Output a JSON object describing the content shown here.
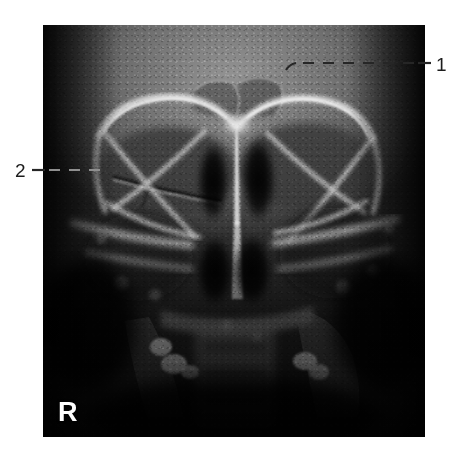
{
  "figure": {
    "type": "radiograph",
    "modality": "plain-film-radiograph",
    "view": "paranasal-sinuses-occipitofrontal",
    "background_color": "#ffffff",
    "plate": {
      "left": 43,
      "top": 25,
      "width": 382,
      "height": 412,
      "border_color": "#0a0a0a"
    }
  },
  "markers": {
    "laterality": {
      "label": "R",
      "meaning": "right-side-marker",
      "color": "#fdfdfd",
      "position": {
        "x": 58,
        "y": 399
      }
    }
  },
  "annotations": {
    "color": "#1c1c1c",
    "line_style": "dashed",
    "items": [
      {
        "id": "callout-1",
        "label": "1",
        "side": "right",
        "number_position": {
          "x": 436,
          "y": 55
        },
        "leader": {
          "solid_from": {
            "x": 431,
            "y": 63
          },
          "solid_to": {
            "x": 419,
            "y": 63
          },
          "dashed_from": {
            "x": 416,
            "y": 63
          },
          "dashed_to": {
            "x": 293,
            "y": 63
          },
          "hook_to": {
            "x": 286,
            "y": 69
          }
        }
      },
      {
        "id": "callout-2",
        "label": "2",
        "side": "left",
        "number_position": {
          "x": 15,
          "y": 161
        },
        "leader": {
          "solid_from": {
            "x": 33,
            "y": 170
          },
          "solid_to": {
            "x": 45,
            "y": 170
          },
          "dashed_from": {
            "x": 48,
            "y": 170
          },
          "dashed_to": {
            "x": 108,
            "y": 170
          },
          "hook_to": {
            "x": 108,
            "y": 170
          }
        }
      }
    ]
  },
  "anatomy": {
    "note": "greyscale-bone-and-air-structures",
    "structures": [
      "frontal-sinus",
      "superior-orbital-rim-right",
      "superior-orbital-rim-left",
      "orbital-floor-line-right",
      "innominate-line-left",
      "ethmoid-air-cells",
      "nasal-septum",
      "inferior-turbinates",
      "maxillary-sinus-right",
      "maxillary-sinus-left",
      "petrous-ridge",
      "dental-restorations"
    ]
  }
}
